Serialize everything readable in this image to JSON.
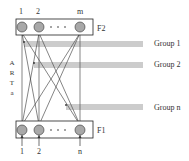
{
  "diagram": {
    "layers": {
      "f2": {
        "label": "F2",
        "node_labels": [
          "1",
          "2",
          "m"
        ],
        "ellipsis": "· · ·"
      },
      "f1": {
        "label": "F1",
        "node_labels": [
          "1",
          "2",
          "n"
        ],
        "ellipsis": "· · ·"
      }
    },
    "side_label": [
      "A",
      "R",
      "T",
      "a"
    ],
    "groups": [
      {
        "label": "Group 1"
      },
      {
        "label": "Group 2"
      },
      {
        "label": "Group n"
      }
    ],
    "colors": {
      "node_fill": "#a8a8a8",
      "line": "#333333",
      "box_stroke": "#222222",
      "bus_line": "#555555"
    }
  }
}
